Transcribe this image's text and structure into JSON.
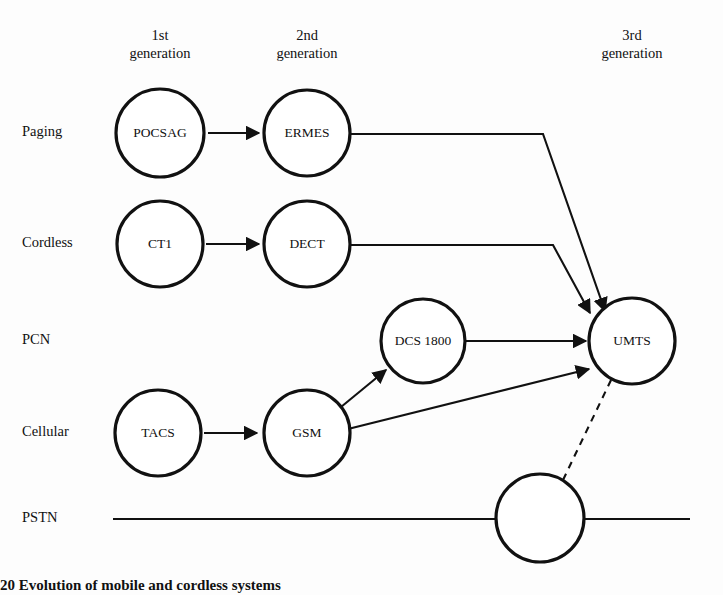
{
  "figure": {
    "title": "Evolution of mobile and cordless systems",
    "caption_prefix": "20",
    "caption_text": "Evolution of mobile and cordless systems",
    "background": "#fdfdfd",
    "ink_color": "#111111"
  },
  "columns": [
    {
      "id": "gen1",
      "line1": "1st",
      "line2": "generation",
      "x": 160
    },
    {
      "id": "gen2",
      "line1": "2nd",
      "line2": "generation",
      "x": 307
    },
    {
      "id": "gen3",
      "line1": "3rd",
      "line2": "generation",
      "x": 632
    }
  ],
  "rows": [
    {
      "id": "paging",
      "label": "Paging",
      "x": 22,
      "y": 133
    },
    {
      "id": "cordless",
      "label": "Cordless",
      "x": 22,
      "y": 244
    },
    {
      "id": "pcn",
      "label": "PCN",
      "x": 22,
      "y": 341
    },
    {
      "id": "cellular",
      "label": "Cellular",
      "x": 22,
      "y": 433
    },
    {
      "id": "pstn",
      "label": "PSTN",
      "x": 22,
      "y": 519
    }
  ],
  "nodes": [
    {
      "id": "pocsag",
      "label": "POCSAG",
      "cx": 160,
      "cy": 133,
      "r": 44,
      "row": "paging",
      "generation": "1st"
    },
    {
      "id": "ermes",
      "label": "ERMES",
      "cx": 307,
      "cy": 133,
      "r": 43,
      "row": "paging",
      "generation": "2nd"
    },
    {
      "id": "ct1",
      "label": "CT1",
      "cx": 160,
      "cy": 244,
      "r": 43,
      "row": "cordless",
      "generation": "1st"
    },
    {
      "id": "dect",
      "label": "DECT",
      "cx": 307,
      "cy": 244,
      "r": 43,
      "row": "cordless",
      "generation": "2nd"
    },
    {
      "id": "dcs1800",
      "label": "DCS 1800",
      "cx": 423,
      "cy": 341,
      "r": 42,
      "row": "pcn",
      "generation": "2nd"
    },
    {
      "id": "umts",
      "label": "UMTS",
      "cx": 632,
      "cy": 341,
      "r": 43,
      "row": "pcn",
      "generation": "3rd"
    },
    {
      "id": "tacs",
      "label": "TACS",
      "cx": 158,
      "cy": 433,
      "r": 43,
      "row": "cellular",
      "generation": "1st"
    },
    {
      "id": "gsm",
      "label": "GSM",
      "cx": 307,
      "cy": 433,
      "r": 43,
      "row": "cellular",
      "generation": "2nd"
    },
    {
      "id": "pstnnode",
      "label": "",
      "cx": 540,
      "cy": 518,
      "r": 44,
      "row": "pstn",
      "generation": ""
    }
  ],
  "edges": [
    {
      "id": "pocsag-ermes",
      "from": "pocsag",
      "to": "ermes",
      "style": "solid",
      "arrow": true,
      "path": "M 208 133 L 259 133"
    },
    {
      "id": "ct1-dect",
      "from": "ct1",
      "to": "dect",
      "style": "solid",
      "arrow": true,
      "path": "M 206 244 L 259 244"
    },
    {
      "id": "tacs-gsm",
      "from": "tacs",
      "to": "gsm",
      "style": "solid",
      "arrow": true,
      "path": "M 204 433 L 257 433"
    },
    {
      "id": "ermes-umts",
      "from": "ermes",
      "to": "umts",
      "style": "solid",
      "arrow": true,
      "path": "M 350 134 L 543 134 L 605 311"
    },
    {
      "id": "dect-umts",
      "from": "dect",
      "to": "umts",
      "style": "solid",
      "arrow": true,
      "path": "M 350 245 L 553 245 L 590 313"
    },
    {
      "id": "gsm-dcs1800",
      "from": "gsm",
      "to": "dcs1800",
      "style": "solid",
      "arrow": true,
      "path": "M 341 407 L 386 370"
    },
    {
      "id": "dcs1800-umts",
      "from": "dcs1800",
      "to": "umts",
      "style": "solid",
      "arrow": true,
      "path": "M 466 341 L 586 341"
    },
    {
      "id": "gsm-umts",
      "from": "gsm",
      "to": "umts",
      "style": "solid",
      "arrow": true,
      "path": "M 348 429 L 589 369"
    },
    {
      "id": "pstn-umts",
      "from": "pstnnode",
      "to": "umts",
      "style": "dashed",
      "arrow": false,
      "path": "M 563 480 L 612 378"
    }
  ],
  "baselines": [
    {
      "id": "pstn-line-left",
      "x1": 113,
      "y1": 519,
      "x2": 497,
      "y2": 519
    },
    {
      "id": "pstn-line-right",
      "x1": 584,
      "y1": 519,
      "x2": 690,
      "y2": 519
    }
  ]
}
